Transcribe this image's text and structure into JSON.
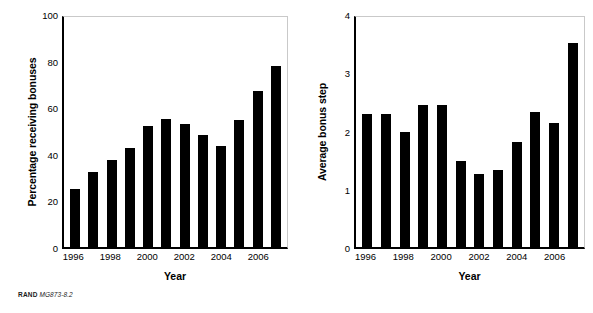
{
  "source_note": {
    "organization": "RAND",
    "figure_code": "MG873-8.2"
  },
  "chart_data": [
    {
      "type": "bar",
      "panel": "left",
      "title": "",
      "xlabel": "Year",
      "ylabel": "Percentage receiving bonuses",
      "categories": [
        "1996",
        "1997",
        "1998",
        "1999",
        "2000",
        "2001",
        "2002",
        "2003",
        "2004",
        "2005",
        "2006",
        "2007"
      ],
      "values": [
        25,
        32,
        37.5,
        42.5,
        52,
        55,
        53,
        48,
        43.5,
        54.5,
        67,
        77.5
      ],
      "ylim": [
        0,
        100
      ],
      "yticks": [
        0,
        20,
        40,
        60,
        80,
        100
      ],
      "ytick_labels": [
        "0",
        "20",
        "40",
        "60",
        "80",
        "100"
      ],
      "xtick_labels": [
        "1996",
        "1998",
        "2000",
        "2002",
        "2004",
        "2006"
      ],
      "xtick_categories": [
        "1996",
        "1998",
        "2000",
        "2002",
        "2004",
        "2006"
      ],
      "grid": false,
      "legend": "none",
      "bar_color": "#000000"
    },
    {
      "type": "bar",
      "panel": "right",
      "title": "",
      "xlabel": "Year",
      "ylabel": "Average bonus step",
      "categories": [
        "1996",
        "1997",
        "1998",
        "1999",
        "2000",
        "2001",
        "2002",
        "2003",
        "2004",
        "2005",
        "2006",
        "2007"
      ],
      "values": [
        2.28,
        2.28,
        1.98,
        2.43,
        2.43,
        1.48,
        1.25,
        1.33,
        1.8,
        2.32,
        2.13,
        3.5
      ],
      "ylim": [
        0,
        4
      ],
      "yticks": [
        0,
        1,
        2,
        3,
        4
      ],
      "ytick_labels": [
        "0",
        "1",
        "2",
        "3",
        "4"
      ],
      "xtick_labels": [
        "1996",
        "1998",
        "2000",
        "2002",
        "2004",
        "2006"
      ],
      "xtick_categories": [
        "1996",
        "1998",
        "2000",
        "2002",
        "2004",
        "2006"
      ],
      "grid": false,
      "legend": "none",
      "bar_color": "#000000"
    }
  ]
}
